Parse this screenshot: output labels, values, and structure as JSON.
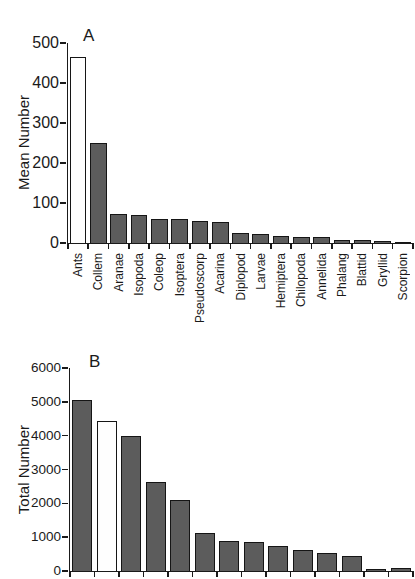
{
  "figure": {
    "background": "#ffffff",
    "bar_fill": "#5c5c5c",
    "bar_highlight_fill": "#fefefe",
    "bar_border": "#151515",
    "axis_color": "#1a1a1a",
    "text_color": "#1a1a1a"
  },
  "chart_data": [
    {
      "type": "bar",
      "panel_label": "A",
      "title": "",
      "xlabel": "",
      "ylabel": "Mean Number",
      "ylim": [
        0,
        500
      ],
      "yticks": [
        0,
        100,
        200,
        300,
        400,
        500
      ],
      "grid": false,
      "legend": "none",
      "categories": [
        "Ants",
        "Collem",
        "Aranae",
        "Isopoda",
        "Coleop",
        "Isoptera",
        "Pseudoscorp",
        "Acarina",
        "Diplopod",
        "Larvae",
        "Hemiptera",
        "Chilopoda",
        "Annelida",
        "Phalang",
        "Blattid",
        "Gryllid",
        "Scorpion"
      ],
      "values": [
        465,
        250,
        72,
        69,
        60,
        59,
        55,
        52,
        26,
        23,
        18,
        15,
        14,
        7,
        7,
        6,
        2
      ],
      "highlight_index": 0
    },
    {
      "type": "bar",
      "panel_label": "B",
      "title": "",
      "xlabel": "",
      "ylabel": "Total Number",
      "ylim": [
        0,
        6000
      ],
      "yticks": [
        0,
        1000,
        2000,
        3000,
        4000,
        5000,
        6000
      ],
      "grid": false,
      "legend": "none",
      "categories": [],
      "values": [
        5050,
        4430,
        4000,
        2620,
        2100,
        1130,
        890,
        850,
        730,
        610,
        545,
        440,
        70,
        95
      ],
      "highlight_index": 1
    }
  ]
}
